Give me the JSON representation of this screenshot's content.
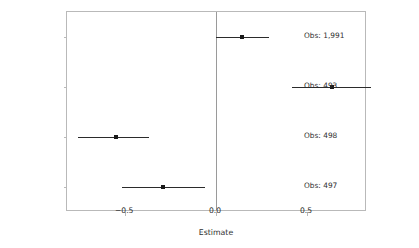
{
  "chart_data": {
    "type": "scatter",
    "subtype": "coefficient-plot-with-error-bars",
    "title": "",
    "xlabel": "Estimate",
    "ylabel": "",
    "xlim": [
      -0.82,
      0.83
    ],
    "ylim": [
      0,
      4
    ],
    "xticks": [
      -0.5,
      0.0,
      0.5
    ],
    "xticklabels": [
      "−0.5",
      "0.0",
      "0.5"
    ],
    "grid": false,
    "legend": null,
    "reference_line": 0.0,
    "categories": [
      "Pct.\nDomestic\nServants",
      "Log\nOwners Over\n100 acres",
      "Log\nAgricultural\nSmallholders",
      "Log\nMunicipality\nIncome"
    ],
    "points": [
      {
        "label": "Pct.\nDomestic\nServants",
        "estimate": -0.29,
        "ci_low": -0.52,
        "ci_high": -0.06,
        "obs_label": "Obs: 497",
        "obs": 497
      },
      {
        "label": "Log\nOwners Over\n100 acres",
        "estimate": -0.55,
        "ci_low": -0.76,
        "ci_high": -0.37,
        "obs_label": "Obs: 498",
        "obs": 498
      },
      {
        "label": "Log\nAgricultural\nSmallholders",
        "estimate": 0.64,
        "ci_low": 0.42,
        "ci_high": 0.85,
        "obs_label": "Obs: 493",
        "obs": 493
      },
      {
        "label": "Log\nMunicipality\nIncome",
        "estimate": 0.14,
        "ci_low": 0.0,
        "ci_high": 0.29,
        "obs_label": "Obs: 1,991",
        "obs": 1991
      }
    ]
  },
  "colors": {
    "point": "#1a1a1a",
    "interval": "#2b2b2b",
    "panel_border": "#b9b9b9",
    "reference_line": "#9a9a9a",
    "text": "#2e2e2e",
    "background": "#ffffff"
  }
}
